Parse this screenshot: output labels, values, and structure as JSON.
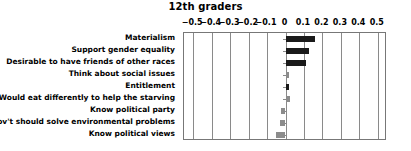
{
  "chart_data": {
    "type": "bar",
    "orientation": "horizontal",
    "title": "12th graders",
    "xlabel": "",
    "ylabel": "",
    "xlim": [
      -0.55,
      0.55
    ],
    "grid": true,
    "legend": false,
    "tick_labels": [
      "−0.5",
      "−0.4",
      "−0.3",
      "−0.2",
      "−0.1",
      "0",
      "0.1",
      "0.2",
      "0.3",
      "0.4",
      "0.5"
    ],
    "tick_values": [
      -0.5,
      -0.4,
      -0.3,
      -0.2,
      -0.1,
      0,
      0.1,
      0.2,
      0.3,
      0.4,
      0.5
    ],
    "categories": [
      "Materialism",
      "Support gender equality",
      "Desirable to have friends of other races",
      "Think about social issues",
      "Entitlement",
      "Would eat differently to help the starving",
      "Know political party",
      "Gov't should solve environmental problems",
      "Know political views"
    ],
    "values": [
      0.16,
      0.13,
      0.11,
      0.02,
      0.02,
      0.025,
      -0.025,
      -0.03,
      -0.05
    ],
    "bar_colors": [
      "#1a1a1a",
      "#1a1a1a",
      "#1a1a1a",
      "#8c8c8c",
      "#1a1a1a",
      "#8c8c8c",
      "#8c8c8c",
      "#8c8c8c",
      "#8c8c8c"
    ],
    "colors": {
      "dark_bar": "#1a1a1a",
      "gray_bar": "#8c8c8c",
      "axis": "#777777",
      "grid": "#8a8a8a",
      "background": "#ffffff",
      "text": "#000000"
    }
  }
}
